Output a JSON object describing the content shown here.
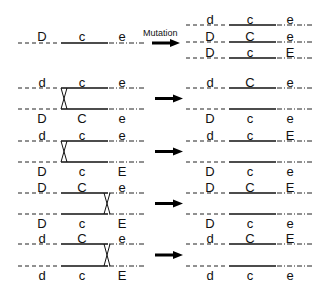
{
  "mutation_label": "Mutation",
  "top": {
    "source": {
      "loci": [
        "D",
        "c",
        "e"
      ]
    },
    "results": [
      {
        "loci": [
          "d",
          "c",
          "e"
        ]
      },
      {
        "loci": [
          "D",
          "C",
          "e"
        ]
      },
      {
        "loci": [
          "D",
          "c",
          "E"
        ]
      }
    ]
  },
  "crossovers": [
    {
      "top": [
        "d",
        "c",
        "e"
      ],
      "bottom": [
        "D",
        "C",
        "e"
      ],
      "crossover_position": "left",
      "result_top": [
        "d",
        "C",
        "e"
      ],
      "result_bottom": [
        "D",
        "c",
        "e"
      ]
    },
    {
      "top": [
        "d",
        "c",
        "e"
      ],
      "bottom": [
        "D",
        "c",
        "E"
      ],
      "crossover_position": "left",
      "result_top": [
        "d",
        "c",
        "E"
      ],
      "result_bottom": [
        "D",
        "c",
        "e"
      ]
    },
    {
      "top": [
        "D",
        "C",
        "e"
      ],
      "bottom": [
        "D",
        "c",
        "E"
      ],
      "crossover_position": "right",
      "result_top": [
        "D",
        "C",
        "E"
      ],
      "result_bottom": [
        "D",
        "c",
        "e"
      ]
    },
    {
      "top": [
        "d",
        "C",
        "e"
      ],
      "bottom": [
        "d",
        "c",
        "E"
      ],
      "crossover_position": "right",
      "result_top": [
        "d",
        "C",
        "E"
      ],
      "result_bottom": [
        "d",
        "c",
        "e"
      ]
    }
  ]
}
